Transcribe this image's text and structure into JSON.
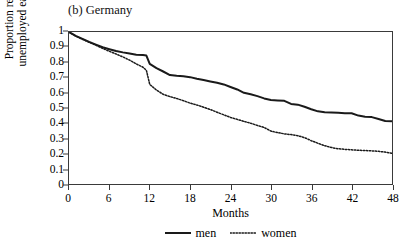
{
  "chart_data": {
    "type": "line",
    "title": "(b) Germany",
    "xlabel": "Months",
    "ylabel_line1": "Proportion remaining",
    "ylabel_line2": "unemployed each month",
    "xlim": [
      0,
      48
    ],
    "ylim": [
      0,
      1
    ],
    "xticks": [
      0,
      6,
      12,
      18,
      24,
      30,
      36,
      42,
      48
    ],
    "xtick_labels": [
      "0",
      "6",
      "12",
      "18",
      "24",
      "30",
      "36",
      "42",
      "48"
    ],
    "yticks": [
      0,
      0.1,
      0.2,
      0.3,
      0.4,
      0.5,
      0.6,
      0.7,
      0.8,
      0.9,
      1
    ],
    "ytick_labels": [
      "0",
      "0.1",
      "0.2",
      "0.3",
      "0.4",
      "0.5",
      "0.6",
      "0.7",
      "0.8",
      "0.9",
      "1"
    ],
    "grid": false,
    "legend_position": "below-axis-center",
    "line_color": "#1a1a1a",
    "frame_color": "#3a3a3a",
    "series": [
      {
        "name": "men",
        "style": "solid",
        "x": [
          0,
          1,
          2,
          3,
          4,
          5,
          6,
          7,
          8,
          9,
          10,
          11,
          11.5,
          12,
          13,
          14,
          15,
          16,
          17,
          18,
          19,
          20,
          21,
          22,
          23,
          24,
          25,
          26,
          27,
          28,
          29,
          30,
          31,
          32,
          33,
          34,
          35,
          36,
          37,
          38,
          39,
          40,
          41,
          42,
          43,
          44,
          45,
          46,
          47,
          48
        ],
        "values": [
          1.0,
          0.975,
          0.955,
          0.935,
          0.917,
          0.9,
          0.887,
          0.875,
          0.866,
          0.858,
          0.851,
          0.848,
          0.845,
          0.79,
          0.762,
          0.74,
          0.717,
          0.712,
          0.709,
          0.703,
          0.693,
          0.684,
          0.675,
          0.666,
          0.655,
          0.638,
          0.622,
          0.6,
          0.59,
          0.578,
          0.563,
          0.553,
          0.55,
          0.547,
          0.527,
          0.522,
          0.508,
          0.492,
          0.478,
          0.472,
          0.47,
          0.468,
          0.466,
          0.465,
          0.45,
          0.443,
          0.44,
          0.428,
          0.415,
          0.412
        ]
      },
      {
        "name": "women",
        "style": "dotted",
        "x": [
          0,
          1,
          2,
          3,
          4,
          5,
          6,
          7,
          8,
          9,
          10,
          11,
          11.5,
          12,
          13,
          14,
          15,
          16,
          17,
          18,
          19,
          20,
          21,
          22,
          23,
          24,
          25,
          26,
          27,
          28,
          29,
          30,
          31,
          32,
          33,
          34,
          35,
          36,
          37,
          38,
          39,
          40,
          41,
          42,
          43,
          44,
          45,
          46,
          47,
          48
        ],
        "values": [
          1.0,
          0.973,
          0.952,
          0.932,
          0.913,
          0.892,
          0.873,
          0.855,
          0.836,
          0.815,
          0.79,
          0.768,
          0.748,
          0.655,
          0.618,
          0.59,
          0.575,
          0.563,
          0.548,
          0.532,
          0.52,
          0.505,
          0.49,
          0.472,
          0.455,
          0.438,
          0.425,
          0.412,
          0.4,
          0.385,
          0.372,
          0.348,
          0.338,
          0.33,
          0.325,
          0.318,
          0.305,
          0.285,
          0.268,
          0.252,
          0.24,
          0.232,
          0.228,
          0.225,
          0.222,
          0.22,
          0.218,
          0.215,
          0.21,
          0.202
        ]
      }
    ],
    "legend": [
      {
        "label": "men",
        "style": "solid"
      },
      {
        "label": "women",
        "style": "dotted"
      }
    ]
  }
}
